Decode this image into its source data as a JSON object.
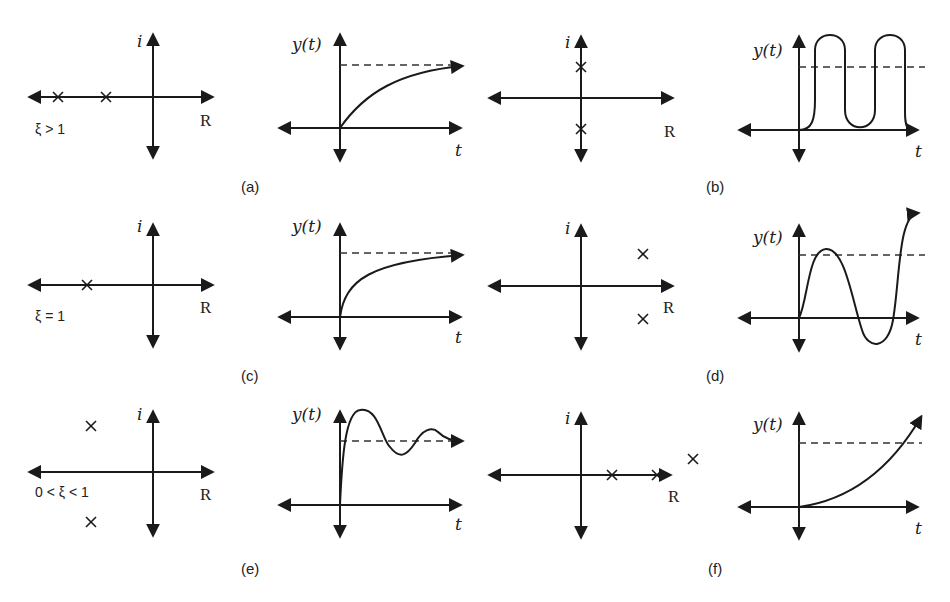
{
  "figure": {
    "axis_labels": {
      "imaginary": "i",
      "real": "R",
      "response": "y(t)",
      "time": "t"
    },
    "panels": [
      {
        "id": "a",
        "caption": "(a)",
        "condition": "ξ > 1",
        "poles": "two distinct real negative poles",
        "response": "overdamped monotonic rise to steady state"
      },
      {
        "id": "b",
        "caption": "(b)",
        "condition": "",
        "poles": "pure imaginary conjugate pair",
        "response": "sustained oscillation"
      },
      {
        "id": "c",
        "caption": "(c)",
        "condition": "ξ = 1",
        "poles": "repeated real negative pole",
        "response": "critically damped rise to steady state"
      },
      {
        "id": "d",
        "caption": "(d)",
        "condition": "",
        "poles": "complex conjugate pair in right half-plane",
        "response": "growing oscillation (unstable)"
      },
      {
        "id": "e",
        "caption": "(e)",
        "condition": "0 < ξ < 1",
        "poles": "complex conjugate pair in left half-plane",
        "response": "underdamped decaying oscillation"
      },
      {
        "id": "f",
        "caption": "(f)",
        "condition": "",
        "poles": "real positive poles",
        "response": "exponential growth (unstable)"
      }
    ]
  },
  "colors": {
    "ink": "#1a1a1a",
    "background": "#ffffff"
  }
}
